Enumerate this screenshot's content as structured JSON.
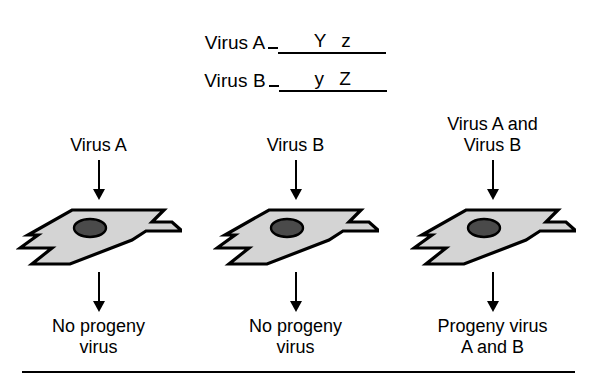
{
  "figure": {
    "background_color": "#ffffff",
    "line_color": "#000000",
    "cell_fill_color": "#d4d4d4",
    "nucleus_fill_color": "#4a4a4a"
  },
  "genotype": {
    "rows": [
      {
        "virus_label": "Virus A",
        "alleles": "Y z"
      },
      {
        "virus_label": "Virus B",
        "alleles": "y Z"
      }
    ]
  },
  "columns": [
    {
      "top_label": "Virus A",
      "bottom_label": "No progeny\nvirus",
      "cell_name": "host-cell"
    },
    {
      "top_label": "Virus B",
      "bottom_label": "No progeny\nvirus",
      "cell_name": "host-cell"
    },
    {
      "top_label": "Virus A and\nVirus B",
      "bottom_label": "Progeny virus\nA and B",
      "cell_name": "host-cell"
    }
  ]
}
